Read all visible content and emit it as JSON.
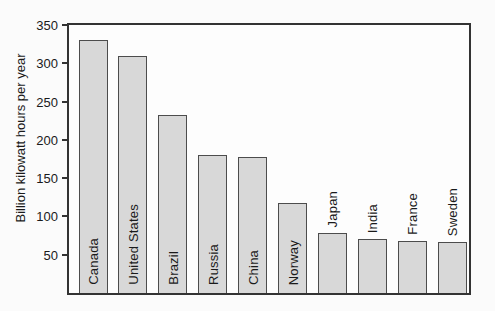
{
  "chart_data": {
    "type": "bar",
    "title": "",
    "xlabel": "",
    "ylabel": "Billion kilowatt hours per year",
    "ylim": [
      0,
      350
    ],
    "yticks": [
      350,
      300,
      250,
      200,
      150,
      100,
      50
    ],
    "grid": false,
    "legend": "none",
    "categories": [
      "Canada",
      "United States",
      "Brazil",
      "Russia",
      "China",
      "Norway",
      "Japan",
      "India",
      "France",
      "Sweden"
    ],
    "values": [
      330,
      310,
      232,
      180,
      178,
      118,
      78,
      70,
      68,
      67
    ],
    "label_placement": [
      "inside",
      "inside",
      "inside",
      "inside",
      "inside",
      "inside",
      "above",
      "above",
      "above",
      "above"
    ],
    "colors": {
      "bar_fill": "#d8d8d8",
      "bar_border": "#4c4c4c",
      "axis": "#333333",
      "text": "#1a1a1a",
      "background": "#fbfbfb"
    }
  }
}
